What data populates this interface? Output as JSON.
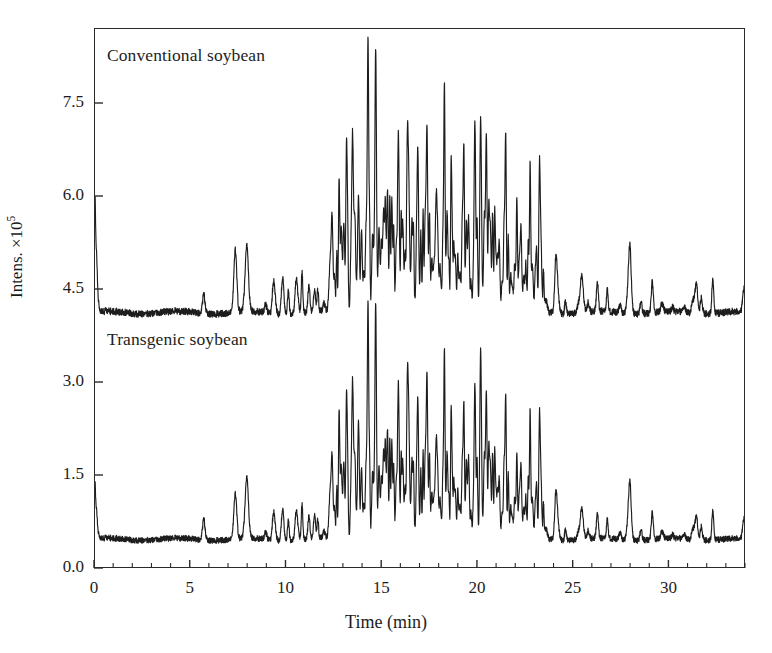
{
  "figure": {
    "background": "#ffffff",
    "ink": "#1d1d1d",
    "frame_color": "#2b2b2b"
  },
  "axes": {
    "x": {
      "title": "Time (min)",
      "ticks": [
        0,
        5,
        10,
        15,
        20,
        25,
        30
      ],
      "tick_labels": [
        "0",
        "5",
        "10",
        "15",
        "20",
        "25",
        "30"
      ],
      "minor_tick_step": 1,
      "range": [
        0,
        34
      ]
    },
    "y": {
      "title_text": "Intens. ×10",
      "title_exponent": "5",
      "ticks": [
        0.0,
        1.5,
        3.0,
        4.5,
        6.0,
        7.5
      ],
      "tick_labels": [
        "0.0",
        "1.5",
        "3.0",
        "4.5",
        "6.0",
        "7.5"
      ],
      "range": [
        0,
        8.7
      ]
    }
  },
  "labels": {
    "conventional": "Conventional soybean",
    "transgenic": "Transgenic soybean"
  },
  "chart_data": {
    "type": "line",
    "title": "",
    "xlabel": "Time (min)",
    "ylabel": "Intens. ×10^5",
    "xlim": [
      0,
      34
    ],
    "ylim": [
      0,
      8.7
    ],
    "grid": false,
    "legend": "inline-annotations",
    "x_tick_values": [
      0,
      5,
      10,
      15,
      20,
      25,
      30
    ],
    "y_tick_values": [
      0.0,
      1.5,
      3.0,
      4.5,
      6.0,
      7.5
    ],
    "series": [
      {
        "name": "Conventional soybean",
        "baseline": 4.12,
        "offset": true,
        "color": "#1d1d1d",
        "peak_apex_intensity": 7.9,
        "peak_apex_time": 14.3,
        "major_peaks": [
          {
            "t": 0.05,
            "y": 5.15
          },
          {
            "t": 5.7,
            "y": 4.42
          },
          {
            "t": 7.35,
            "y": 5.13
          },
          {
            "t": 7.95,
            "y": 5.17
          },
          {
            "t": 9.4,
            "y": 4.43
          },
          {
            "t": 10.6,
            "y": 4.38
          },
          {
            "t": 11.5,
            "y": 4.45
          },
          {
            "t": 12.3,
            "y": 4.62
          },
          {
            "t": 12.8,
            "y": 4.78
          },
          {
            "t": 13.2,
            "y": 5.95
          },
          {
            "t": 13.5,
            "y": 6.25
          },
          {
            "t": 13.8,
            "y": 5.7
          },
          {
            "t": 14.3,
            "y": 7.9
          },
          {
            "t": 14.7,
            "y": 6.8
          },
          {
            "t": 15.3,
            "y": 5.3
          },
          {
            "t": 15.9,
            "y": 5.45
          },
          {
            "t": 16.4,
            "y": 5.75
          },
          {
            "t": 16.9,
            "y": 5.35
          },
          {
            "t": 17.4,
            "y": 5.7
          },
          {
            "t": 17.9,
            "y": 5.5
          },
          {
            "t": 18.3,
            "y": 6.55
          },
          {
            "t": 18.7,
            "y": 5.4
          },
          {
            "t": 19.3,
            "y": 5.8
          },
          {
            "t": 19.9,
            "y": 6.5
          },
          {
            "t": 20.2,
            "y": 6.6
          },
          {
            "t": 20.5,
            "y": 6.15
          },
          {
            "t": 21.0,
            "y": 4.9
          },
          {
            "t": 21.5,
            "y": 5.9
          },
          {
            "t": 22.1,
            "y": 5.0
          },
          {
            "t": 22.8,
            "y": 5.05
          },
          {
            "t": 23.3,
            "y": 4.95
          },
          {
            "t": 24.2,
            "y": 4.6
          },
          {
            "t": 25.5,
            "y": 4.72
          },
          {
            "t": 28.0,
            "y": 5.0
          },
          {
            "t": 31.5,
            "y": 4.62
          }
        ]
      },
      {
        "name": "Transgenic soybean",
        "baseline": 0.45,
        "offset": false,
        "color": "#1d1d1d",
        "peak_apex_intensity": 3.72,
        "peak_apex_time": 14.3,
        "major_peaks": [
          {
            "t": 0.05,
            "y": 0.95
          },
          {
            "t": 5.7,
            "y": 0.78
          },
          {
            "t": 7.35,
            "y": 1.18
          },
          {
            "t": 7.95,
            "y": 1.42
          },
          {
            "t": 9.4,
            "y": 0.72
          },
          {
            "t": 10.6,
            "y": 0.66
          },
          {
            "t": 11.5,
            "y": 0.82
          },
          {
            "t": 12.3,
            "y": 0.95
          },
          {
            "t": 12.8,
            "y": 1.25
          },
          {
            "t": 13.2,
            "y": 2.0
          },
          {
            "t": 13.5,
            "y": 2.35
          },
          {
            "t": 13.8,
            "y": 2.1
          },
          {
            "t": 14.3,
            "y": 3.72
          },
          {
            "t": 14.7,
            "y": 2.9
          },
          {
            "t": 15.3,
            "y": 1.55
          },
          {
            "t": 15.9,
            "y": 1.62
          },
          {
            "t": 16.4,
            "y": 2.05
          },
          {
            "t": 16.9,
            "y": 1.5
          },
          {
            "t": 17.4,
            "y": 1.9
          },
          {
            "t": 17.9,
            "y": 1.6
          },
          {
            "t": 18.3,
            "y": 2.42
          },
          {
            "t": 18.7,
            "y": 1.5
          },
          {
            "t": 19.3,
            "y": 1.75
          },
          {
            "t": 19.9,
            "y": 2.35
          },
          {
            "t": 20.2,
            "y": 2.95
          },
          {
            "t": 20.5,
            "y": 2.1
          },
          {
            "t": 21.0,
            "y": 1.15
          },
          {
            "t": 21.5,
            "y": 1.8
          },
          {
            "t": 22.1,
            "y": 1.0
          },
          {
            "t": 22.8,
            "y": 1.25
          },
          {
            "t": 23.3,
            "y": 1.1
          },
          {
            "t": 24.2,
            "y": 0.85
          },
          {
            "t": 25.5,
            "y": 0.95
          },
          {
            "t": 28.0,
            "y": 1.2
          },
          {
            "t": 31.5,
            "y": 0.85
          }
        ]
      }
    ]
  }
}
